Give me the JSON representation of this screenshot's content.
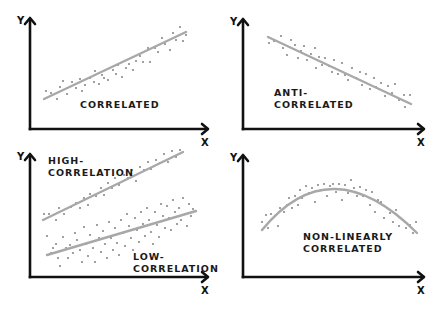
{
  "colors": {
    "axis": "#111111",
    "trend": "#a8a8a8",
    "dots": "#8a8a8a",
    "background": "#ffffff"
  },
  "axis_labels": {
    "x": "X",
    "y": "Y"
  },
  "panels": [
    {
      "id": "correlated",
      "caption_lines": [
        "CORRELATED"
      ],
      "caption_pos": [
        80,
        108
      ],
      "axes": {
        "x0": 30,
        "y_top": 18,
        "y_axis_bottom": 129,
        "x_end": 208
      },
      "trend": {
        "type": "line",
        "points": [
          [
            44,
            99
          ],
          [
            186,
            32
          ]
        ]
      },
      "dots": [
        [
          46,
          91
        ],
        [
          51,
          93
        ],
        [
          57,
          99
        ],
        [
          60,
          87
        ],
        [
          63,
          81
        ],
        [
          67,
          94
        ],
        [
          72,
          82
        ],
        [
          76,
          88
        ],
        [
          80,
          79
        ],
        [
          82,
          91
        ],
        [
          85,
          85
        ],
        [
          90,
          78
        ],
        [
          94,
          82
        ],
        [
          95,
          71
        ],
        [
          99,
          84
        ],
        [
          102,
          75
        ],
        [
          104,
          78
        ],
        [
          108,
          80
        ],
        [
          113,
          70
        ],
        [
          116,
          74
        ],
        [
          118,
          65
        ],
        [
          122,
          77
        ],
        [
          126,
          68
        ],
        [
          129,
          64
        ],
        [
          133,
          70
        ],
        [
          136,
          61
        ],
        [
          140,
          56
        ],
        [
          143,
          62
        ],
        [
          148,
          48
        ],
        [
          150,
          62
        ],
        [
          155,
          48
        ],
        [
          158,
          52
        ],
        [
          162,
          38
        ],
        [
          165,
          44
        ],
        [
          170,
          50
        ],
        [
          173,
          33
        ],
        [
          176,
          40
        ],
        [
          180,
          27
        ],
        [
          183,
          41
        ],
        [
          186,
          35
        ]
      ]
    },
    {
      "id": "anti-correlated",
      "caption_lines": [
        "ANTI-",
        "CORRELATED"
      ],
      "caption_pos": [
        274,
        96
      ],
      "axes": {
        "x0": 243,
        "y_top": 19,
        "y_axis_bottom": 129,
        "x_end": 424
      },
      "trend": {
        "type": "line",
        "points": [
          [
            268,
            37
          ],
          [
            411,
            104
          ]
        ]
      },
      "dots": [
        [
          269,
          43
        ],
        [
          274,
          41
        ],
        [
          281,
          36
        ],
        [
          283,
          48
        ],
        [
          287,
          55
        ],
        [
          291,
          40
        ],
        [
          295,
          45
        ],
        [
          298,
          58
        ],
        [
          301,
          51
        ],
        [
          304,
          46
        ],
        [
          307,
          60
        ],
        [
          311,
          54
        ],
        [
          315,
          48
        ],
        [
          316,
          68
        ],
        [
          319,
          57
        ],
        [
          322,
          65
        ],
        [
          325,
          58
        ],
        [
          329,
          66
        ],
        [
          332,
          72
        ],
        [
          334,
          60
        ],
        [
          338,
          74
        ],
        [
          342,
          63
        ],
        [
          345,
          75
        ],
        [
          348,
          80
        ],
        [
          352,
          68
        ],
        [
          356,
          78
        ],
        [
          360,
          72
        ],
        [
          362,
          85
        ],
        [
          366,
          74
        ],
        [
          370,
          89
        ],
        [
          374,
          78
        ],
        [
          376,
          87
        ],
        [
          381,
          83
        ],
        [
          385,
          96
        ],
        [
          388,
          86
        ],
        [
          392,
          93
        ],
        [
          395,
          84
        ],
        [
          399,
          100
        ],
        [
          404,
          95
        ],
        [
          405,
          107
        ],
        [
          410,
          95
        ]
      ]
    },
    {
      "id": "high-low-correlation",
      "captions": [
        {
          "lines": [
            "HIGH-",
            "CORRELATION"
          ],
          "pos": [
            48,
            164
          ]
        },
        {
          "lines": [
            "LOW-",
            "CORRELATION"
          ],
          "pos": [
            133,
            260
          ]
        }
      ],
      "axes": {
        "x0": 30,
        "y_top": 154,
        "y_axis_bottom": 277,
        "x_end": 208
      },
      "trends": [
        {
          "name": "high",
          "type": "line",
          "points": [
            [
              43,
              220
            ],
            [
              183,
              152
            ]
          ]
        },
        {
          "name": "low",
          "type": "line",
          "points": [
            [
              47,
              255
            ],
            [
              196,
              211
            ]
          ]
        }
      ],
      "dots_high": [
        [
          44,
          214
        ],
        [
          49,
          214
        ],
        [
          56,
          220
        ],
        [
          59,
          208
        ],
        [
          64,
          214
        ],
        [
          71,
          207
        ],
        [
          76,
          203
        ],
        [
          80,
          208
        ],
        [
          84,
          198
        ],
        [
          88,
          205
        ],
        [
          90,
          194
        ],
        [
          96,
          196
        ],
        [
          101,
          188
        ],
        [
          104,
          195
        ],
        [
          108,
          183
        ],
        [
          112,
          188
        ],
        [
          115,
          178
        ],
        [
          119,
          185
        ],
        [
          124,
          175
        ],
        [
          128,
          178
        ],
        [
          132,
          170
        ],
        [
          136,
          181
        ],
        [
          140,
          167
        ],
        [
          144,
          170
        ],
        [
          148,
          162
        ],
        [
          151,
          169
        ],
        [
          156,
          160
        ],
        [
          160,
          163
        ],
        [
          164,
          154
        ],
        [
          168,
          162
        ],
        [
          172,
          151
        ],
        [
          176,
          157
        ],
        [
          180,
          150
        ]
      ],
      "dots_low": [
        [
          47,
          236
        ],
        [
          51,
          253
        ],
        [
          53,
          248
        ],
        [
          56,
          244
        ],
        [
          58,
          258
        ],
        [
          60,
          266
        ],
        [
          63,
          237
        ],
        [
          66,
          248
        ],
        [
          68,
          258
        ],
        [
          70,
          245
        ],
        [
          73,
          253
        ],
        [
          75,
          233
        ],
        [
          77,
          240
        ],
        [
          80,
          250
        ],
        [
          82,
          262
        ],
        [
          84,
          227
        ],
        [
          86,
          244
        ],
        [
          88,
          256
        ],
        [
          90,
          235
        ],
        [
          93,
          248
        ],
        [
          95,
          262
        ],
        [
          97,
          225
        ],
        [
          99,
          238
        ],
        [
          101,
          252
        ],
        [
          103,
          231
        ],
        [
          105,
          244
        ],
        [
          107,
          258
        ],
        [
          109,
          222
        ],
        [
          111,
          238
        ],
        [
          113,
          250
        ],
        [
          115,
          228
        ],
        [
          117,
          243
        ],
        [
          119,
          255
        ],
        [
          121,
          220
        ],
        [
          123,
          233
        ],
        [
          125,
          246
        ],
        [
          127,
          214
        ],
        [
          129,
          226
        ],
        [
          131,
          238
        ],
        [
          133,
          250
        ],
        [
          135,
          218
        ],
        [
          137,
          230
        ],
        [
          139,
          242
        ],
        [
          141,
          212
        ],
        [
          143,
          224
        ],
        [
          145,
          236
        ],
        [
          147,
          208
        ],
        [
          149,
          220
        ],
        [
          151,
          232
        ],
        [
          153,
          244
        ],
        [
          155,
          212
        ],
        [
          157,
          225
        ],
        [
          159,
          237
        ],
        [
          161,
          204
        ],
        [
          163,
          216
        ],
        [
          165,
          228
        ],
        [
          167,
          206
        ],
        [
          169,
          218
        ],
        [
          171,
          230
        ],
        [
          173,
          200
        ],
        [
          175,
          212
        ],
        [
          177,
          224
        ],
        [
          179,
          208
        ],
        [
          181,
          220
        ],
        [
          183,
          198
        ],
        [
          185,
          214
        ],
        [
          187,
          226
        ],
        [
          189,
          204
        ],
        [
          191,
          216
        ],
        [
          193,
          209
        ]
      ]
    },
    {
      "id": "non-linearly-correlated",
      "caption_lines": [
        "NON-LINEARLY",
        "CORRELATED"
      ],
      "caption_pos": [
        303,
        240
      ],
      "axes": {
        "x0": 243,
        "y_top": 155,
        "y_axis_bottom": 277,
        "x_end": 424
      },
      "trend": {
        "type": "curve",
        "points": [
          [
            262,
            230
          ],
          [
            335,
            189
          ],
          [
            417,
            233
          ]
        ]
      },
      "dots": [
        [
          262,
          222
        ],
        [
          266,
          215
        ],
        [
          268,
          228
        ],
        [
          271,
          214
        ],
        [
          275,
          216
        ],
        [
          278,
          226
        ],
        [
          280,
          208
        ],
        [
          284,
          212
        ],
        [
          287,
          205
        ],
        [
          289,
          198
        ],
        [
          292,
          208
        ],
        [
          295,
          196
        ],
        [
          298,
          205
        ],
        [
          300,
          190
        ],
        [
          302,
          198
        ],
        [
          306,
          186
        ],
        [
          309,
          193
        ],
        [
          312,
          188
        ],
        [
          315,
          202
        ],
        [
          318,
          185
        ],
        [
          321,
          190
        ],
        [
          324,
          184
        ],
        [
          327,
          196
        ],
        [
          330,
          186
        ],
        [
          333,
          184
        ],
        [
          336,
          192
        ],
        [
          339,
          184
        ],
        [
          342,
          200
        ],
        [
          345,
          185
        ],
        [
          348,
          193
        ],
        [
          351,
          180
        ],
        [
          354,
          188
        ],
        [
          357,
          196
        ],
        [
          360,
          187
        ],
        [
          363,
          196
        ],
        [
          366,
          190
        ],
        [
          370,
          205
        ],
        [
          372,
          192
        ],
        [
          375,
          212
        ],
        [
          378,
          200
        ],
        [
          381,
          202
        ],
        [
          384,
          218
        ],
        [
          387,
          208
        ],
        [
          390,
          213
        ],
        [
          393,
          222
        ],
        [
          396,
          210
        ],
        [
          399,
          226
        ],
        [
          403,
          220
        ],
        [
          406,
          228
        ],
        [
          410,
          225
        ],
        [
          413,
          233
        ],
        [
          416,
          222
        ]
      ]
    }
  ]
}
